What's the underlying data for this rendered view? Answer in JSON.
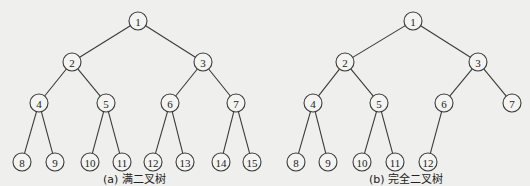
{
  "trees": [
    {
      "id": "a",
      "caption": "(a) 满二叉树",
      "nodes": [
        "1",
        "2",
        "3",
        "4",
        "5",
        "6",
        "7",
        "8",
        "9",
        "10",
        "11",
        "12",
        "13",
        "14",
        "15"
      ],
      "edges": [
        [
          "1",
          "2"
        ],
        [
          "1",
          "3"
        ],
        [
          "2",
          "4"
        ],
        [
          "2",
          "5"
        ],
        [
          "3",
          "6"
        ],
        [
          "3",
          "7"
        ],
        [
          "4",
          "8"
        ],
        [
          "4",
          "9"
        ],
        [
          "5",
          "10"
        ],
        [
          "5",
          "11"
        ],
        [
          "6",
          "12"
        ],
        [
          "6",
          "13"
        ],
        [
          "7",
          "14"
        ],
        [
          "7",
          "15"
        ]
      ]
    },
    {
      "id": "b",
      "caption": "(b) 完全二叉树",
      "nodes": [
        "1",
        "2",
        "3",
        "4",
        "5",
        "6",
        "7",
        "8",
        "9",
        "10",
        "11",
        "12"
      ],
      "edges": [
        [
          "1",
          "2"
        ],
        [
          "1",
          "3"
        ],
        [
          "2",
          "4"
        ],
        [
          "2",
          "5"
        ],
        [
          "3",
          "6"
        ],
        [
          "3",
          "7"
        ],
        [
          "4",
          "8"
        ],
        [
          "4",
          "9"
        ],
        [
          "5",
          "10"
        ],
        [
          "5",
          "11"
        ],
        [
          "6",
          "12"
        ]
      ]
    }
  ]
}
